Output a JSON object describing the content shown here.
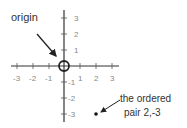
{
  "diagram": {
    "colors": {
      "axis": "#333333",
      "tick_label": "#888888",
      "text": "#333333",
      "background": "#ffffff"
    },
    "x_ticks": [
      "-3",
      "-2",
      "-1",
      "1",
      "2",
      "3"
    ],
    "y_ticks": [
      "3",
      "2",
      "1",
      "-1",
      "-2",
      "-3"
    ],
    "annotations": {
      "origin_label": "origin",
      "point_label_line1": "the ordered",
      "point_label_line2": "pair 2,-3"
    },
    "point": {
      "x": 2,
      "y": -3
    }
  }
}
